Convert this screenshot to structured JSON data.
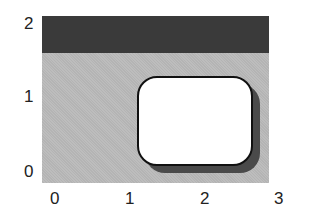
{
  "diagram": {
    "y_ticks": [
      "2",
      "1",
      "0"
    ],
    "x_ticks": [
      "0",
      "1",
      "2",
      "3"
    ],
    "colors": {
      "background": "#b4b4b4",
      "top_band": "#3a3a3a",
      "box_fill": "#ffffff",
      "box_border": "#111111",
      "shadow": "#4a4a4a"
    }
  }
}
